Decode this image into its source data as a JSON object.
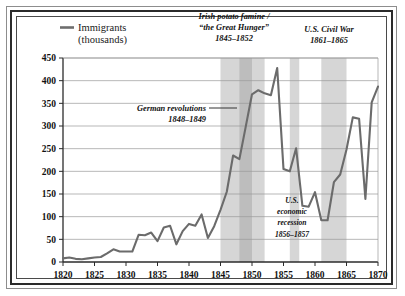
{
  "legend": {
    "swatch_color": "#6e6e6e",
    "line1": "Immigrants",
    "line2": "(thousands)"
  },
  "axes": {
    "y_ticks": [
      "0",
      "50",
      "100",
      "150",
      "200",
      "250",
      "300",
      "350",
      "400",
      "450"
    ],
    "x_ticks": [
      "1820",
      "1825",
      "1830",
      "1835",
      "1840",
      "1845",
      "1850",
      "1855",
      "1860",
      "1865",
      "1870"
    ]
  },
  "annotations": {
    "famine": {
      "line1": "Irish potato famine /",
      "line2": "“the Great Hunger”",
      "line3": "1845–1852"
    },
    "civil_war": {
      "line1": "U.S. Civil War",
      "line2": "1861–1865"
    },
    "german": {
      "line1": "German revolutions",
      "line2": "1848–1849"
    },
    "recession": {
      "line1": "U.S.",
      "line2": "economic",
      "line3": "recession",
      "line4": "1856–1857"
    }
  },
  "colors": {
    "line": "#6b6b6b",
    "grid": "#9a9a9a",
    "axis": "#2b2b2b",
    "band_light": "#d6d6d6",
    "band_dark": "#bdbdbd",
    "frame_outer": "#8d8d8d",
    "frame_inner": "#2b2b2b",
    "background": "#ffffff"
  },
  "chart_data": {
    "type": "line",
    "title": "",
    "subtitle": "",
    "xlabel": "",
    "ylabel": "Immigrants (thousands)",
    "xlim": [
      1820,
      1870
    ],
    "ylim": [
      0,
      450
    ],
    "ytick_step": 50,
    "xtick_step": 5,
    "grid": true,
    "legend_position": "top-left",
    "series": [
      {
        "name": "Immigrants (thousands)",
        "x": [
          1820,
          1821,
          1822,
          1823,
          1824,
          1825,
          1826,
          1827,
          1828,
          1829,
          1830,
          1831,
          1832,
          1833,
          1834,
          1835,
          1836,
          1837,
          1838,
          1839,
          1840,
          1841,
          1842,
          1843,
          1844,
          1845,
          1846,
          1847,
          1848,
          1849,
          1850,
          1851,
          1852,
          1853,
          1854,
          1855,
          1856,
          1857,
          1858,
          1859,
          1860,
          1861,
          1862,
          1863,
          1864,
          1865,
          1866,
          1867,
          1868,
          1869,
          1870
        ],
        "values": [
          8,
          10,
          7,
          6,
          8,
          10,
          11,
          19,
          28,
          23,
          23,
          23,
          60,
          59,
          65,
          46,
          76,
          80,
          39,
          68,
          84,
          80,
          105,
          53,
          79,
          115,
          155,
          235,
          227,
          298,
          370,
          379,
          372,
          368,
          428,
          205,
          200,
          251,
          124,
          122,
          154,
          92,
          92,
          176,
          193,
          248,
          319,
          316,
          139,
          352,
          387
        ]
      }
    ],
    "bands": [
      {
        "name": "Irish potato famine / the Great Hunger",
        "start": 1845,
        "end": 1852,
        "shade": "light"
      },
      {
        "name": "German revolutions",
        "start": 1848,
        "end": 1850,
        "shade": "dark"
      },
      {
        "name": "U.S. economic recession",
        "start": 1856,
        "end": 1857.5,
        "shade": "light"
      },
      {
        "name": "U.S. Civil War",
        "start": 1861,
        "end": 1865,
        "shade": "light"
      }
    ]
  }
}
